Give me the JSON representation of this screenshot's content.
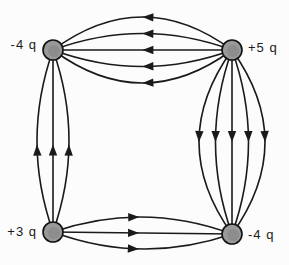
{
  "figure": {
    "name": "electric-field-lines-four-point-charges",
    "background_color": "#fcfcfc",
    "line_color": "#1a1a1a",
    "charge_fill_color": "#999999",
    "charge_inner_color": "#8a8a8a",
    "charge_stroke_color": "#111111",
    "charge_radius": 10,
    "line_width": 1.6,
    "arrow_length": 11,
    "arrow_half_width": 4.2,
    "charges": [
      {
        "id": "top-left",
        "label": "-4 q",
        "x": 53,
        "y": 50,
        "label_side": "left"
      },
      {
        "id": "top-right",
        "label": "+5 q",
        "x": 232,
        "y": 50,
        "label_side": "right"
      },
      {
        "id": "bottom-left",
        "label": "+3 q",
        "x": 53,
        "y": 232,
        "label_side": "left"
      },
      {
        "id": "bottom-right",
        "label": "-4 q",
        "x": 232,
        "y": 234,
        "label_side": "right"
      }
    ],
    "field_line_bundles": [
      {
        "from": "top-right",
        "to": "top-left",
        "lines": 5,
        "max_bow": 33,
        "arrow_t": 0.47,
        "arrow_direction": "left"
      },
      {
        "from": "top-right",
        "to": "bottom-right",
        "lines": 5,
        "max_bow": 33,
        "arrow_t": 0.47,
        "arrow_direction": "down"
      },
      {
        "from": "bottom-left",
        "to": "top-left",
        "lines": 3,
        "max_bow": 16,
        "arrow_t": 0.45,
        "arrow_direction": "up"
      },
      {
        "from": "bottom-left",
        "to": "bottom-right",
        "lines": 3,
        "max_bow": 16,
        "arrow_t": 0.45,
        "arrow_direction": "right"
      }
    ]
  }
}
